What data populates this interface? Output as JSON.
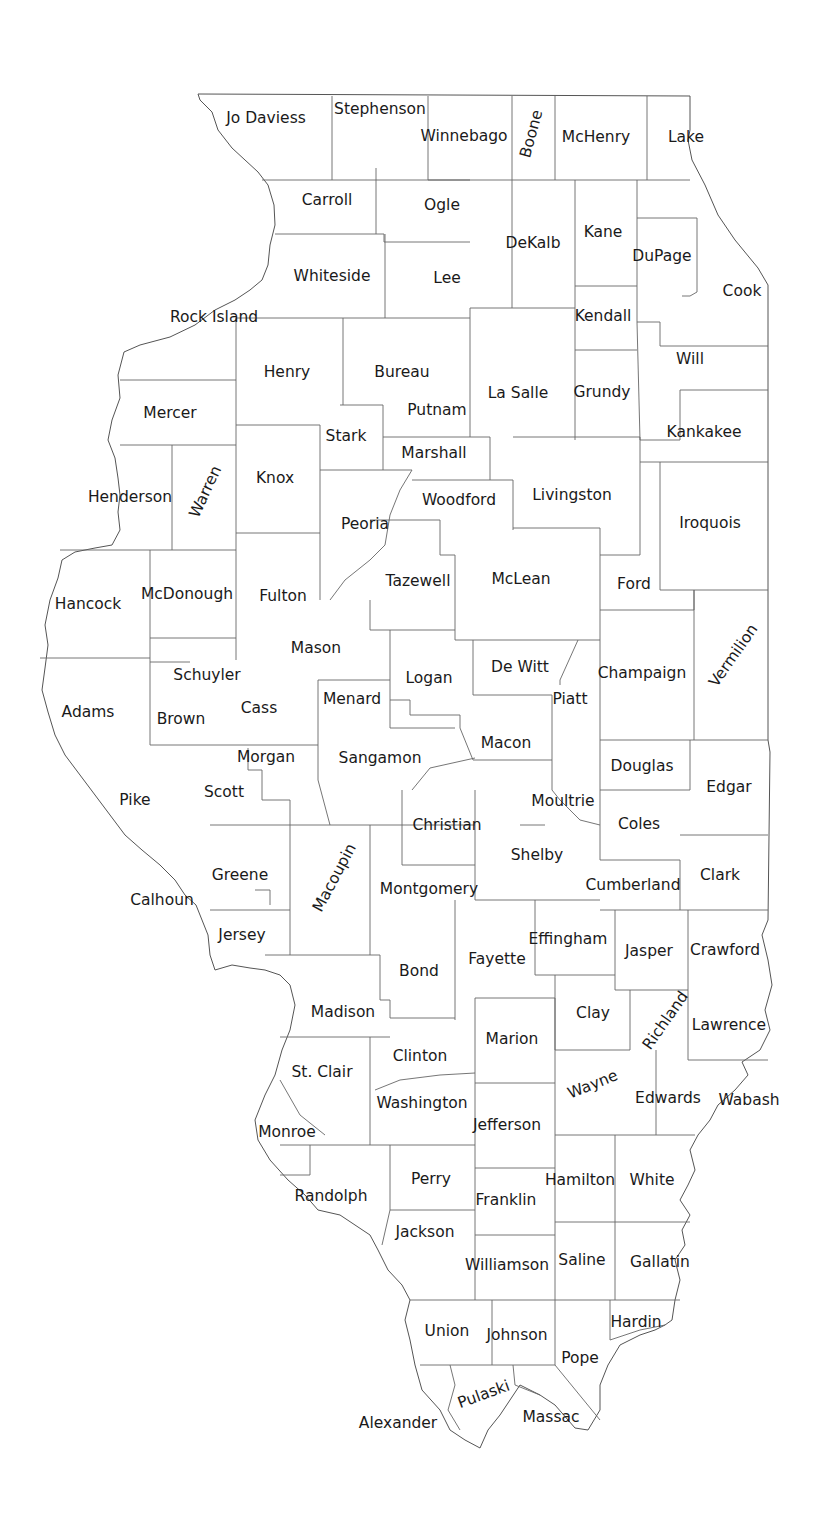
{
  "map": {
    "region": "Illinois",
    "line_color": "#555555",
    "label_color": "#1a1a1a",
    "counties": [
      {
        "name": "Jo Daviess",
        "x": 266,
        "y": 119
      },
      {
        "name": "Stephenson",
        "x": 380,
        "y": 110
      },
      {
        "name": "Winnebago",
        "x": 464,
        "y": 137
      },
      {
        "name": "Boone",
        "x": 532,
        "y": 134,
        "rotate": -75
      },
      {
        "name": "McHenry",
        "x": 596,
        "y": 138
      },
      {
        "name": "Lake",
        "x": 686,
        "y": 138
      },
      {
        "name": "Carroll",
        "x": 327,
        "y": 201
      },
      {
        "name": "Ogle",
        "x": 442,
        "y": 206
      },
      {
        "name": "DeKalb",
        "x": 533,
        "y": 244
      },
      {
        "name": "Kane",
        "x": 603,
        "y": 233
      },
      {
        "name": "DuPage",
        "x": 662,
        "y": 257
      },
      {
        "name": "Cook",
        "x": 742,
        "y": 292
      },
      {
        "name": "Whiteside",
        "x": 332,
        "y": 277
      },
      {
        "name": "Lee",
        "x": 447,
        "y": 279
      },
      {
        "name": "Rock Island",
        "x": 214,
        "y": 318
      },
      {
        "name": "Kendall",
        "x": 603,
        "y": 317
      },
      {
        "name": "Henry",
        "x": 287,
        "y": 373
      },
      {
        "name": "Bureau",
        "x": 402,
        "y": 373
      },
      {
        "name": "La Salle",
        "x": 518,
        "y": 394
      },
      {
        "name": "Grundy",
        "x": 602,
        "y": 393
      },
      {
        "name": "Will",
        "x": 690,
        "y": 360
      },
      {
        "name": "Putnam",
        "x": 437,
        "y": 411
      },
      {
        "name": "Mercer",
        "x": 170,
        "y": 414
      },
      {
        "name": "Stark",
        "x": 346,
        "y": 437
      },
      {
        "name": "Kankakee",
        "x": 704,
        "y": 433
      },
      {
        "name": "Marshall",
        "x": 434,
        "y": 454
      },
      {
        "name": "Knox",
        "x": 275,
        "y": 479
      },
      {
        "name": "Henderson",
        "x": 130,
        "y": 498
      },
      {
        "name": "Warren",
        "x": 206,
        "y": 492,
        "rotate": -65
      },
      {
        "name": "Woodford",
        "x": 459,
        "y": 501
      },
      {
        "name": "Livingston",
        "x": 572,
        "y": 496
      },
      {
        "name": "Iroquois",
        "x": 710,
        "y": 524
      },
      {
        "name": "Peoria",
        "x": 365,
        "y": 525
      },
      {
        "name": "Tazewell",
        "x": 418,
        "y": 582
      },
      {
        "name": "McLean",
        "x": 521,
        "y": 580
      },
      {
        "name": "Ford",
        "x": 634,
        "y": 585
      },
      {
        "name": "Hancock",
        "x": 88,
        "y": 605
      },
      {
        "name": "McDonough",
        "x": 187,
        "y": 595
      },
      {
        "name": "Fulton",
        "x": 283,
        "y": 597
      },
      {
        "name": "Mason",
        "x": 316,
        "y": 649
      },
      {
        "name": "Vermilion",
        "x": 734,
        "y": 656,
        "rotate": -55
      },
      {
        "name": "De Witt",
        "x": 520,
        "y": 668
      },
      {
        "name": "Champaign",
        "x": 642,
        "y": 674
      },
      {
        "name": "Schuyler",
        "x": 207,
        "y": 676
      },
      {
        "name": "Logan",
        "x": 429,
        "y": 679
      },
      {
        "name": "Menard",
        "x": 352,
        "y": 700
      },
      {
        "name": "Cass",
        "x": 259,
        "y": 709
      },
      {
        "name": "Piatt",
        "x": 570,
        "y": 700
      },
      {
        "name": "Adams",
        "x": 88,
        "y": 713
      },
      {
        "name": "Brown",
        "x": 181,
        "y": 720
      },
      {
        "name": "Macon",
        "x": 506,
        "y": 744
      },
      {
        "name": "Morgan",
        "x": 266,
        "y": 758
      },
      {
        "name": "Sangamon",
        "x": 380,
        "y": 759
      },
      {
        "name": "Douglas",
        "x": 642,
        "y": 767
      },
      {
        "name": "Edgar",
        "x": 729,
        "y": 788
      },
      {
        "name": "Scott",
        "x": 224,
        "y": 793
      },
      {
        "name": "Pike",
        "x": 135,
        "y": 801
      },
      {
        "name": "Moultrie",
        "x": 563,
        "y": 802
      },
      {
        "name": "Christian",
        "x": 447,
        "y": 826
      },
      {
        "name": "Coles",
        "x": 639,
        "y": 825
      },
      {
        "name": "Shelby",
        "x": 537,
        "y": 856
      },
      {
        "name": "Macoupin",
        "x": 335,
        "y": 878,
        "rotate": -62
      },
      {
        "name": "Greene",
        "x": 240,
        "y": 876
      },
      {
        "name": "Clark",
        "x": 720,
        "y": 876
      },
      {
        "name": "Montgomery",
        "x": 429,
        "y": 890
      },
      {
        "name": "Cumberland",
        "x": 633,
        "y": 886
      },
      {
        "name": "Calhoun",
        "x": 162,
        "y": 901
      },
      {
        "name": "Jersey",
        "x": 242,
        "y": 936
      },
      {
        "name": "Effingham",
        "x": 568,
        "y": 940
      },
      {
        "name": "Jasper",
        "x": 649,
        "y": 952
      },
      {
        "name": "Crawford",
        "x": 725,
        "y": 951
      },
      {
        "name": "Fayette",
        "x": 497,
        "y": 960
      },
      {
        "name": "Bond",
        "x": 419,
        "y": 972
      },
      {
        "name": "Clay",
        "x": 593,
        "y": 1014
      },
      {
        "name": "Richland",
        "x": 666,
        "y": 1021,
        "rotate": -55
      },
      {
        "name": "Madison",
        "x": 343,
        "y": 1013
      },
      {
        "name": "Lawrence",
        "x": 729,
        "y": 1026
      },
      {
        "name": "Marion",
        "x": 512,
        "y": 1040
      },
      {
        "name": "Clinton",
        "x": 420,
        "y": 1057
      },
      {
        "name": "Wayne",
        "x": 593,
        "y": 1085,
        "rotate": -22
      },
      {
        "name": "St. Clair",
        "x": 322,
        "y": 1073
      },
      {
        "name": "Edwards",
        "x": 668,
        "y": 1099
      },
      {
        "name": "Wabash",
        "x": 749,
        "y": 1101
      },
      {
        "name": "Washington",
        "x": 422,
        "y": 1104
      },
      {
        "name": "Jefferson",
        "x": 507,
        "y": 1126
      },
      {
        "name": "Monroe",
        "x": 287,
        "y": 1133
      },
      {
        "name": "Perry",
        "x": 431,
        "y": 1180
      },
      {
        "name": "Hamilton",
        "x": 580,
        "y": 1181
      },
      {
        "name": "White",
        "x": 652,
        "y": 1181
      },
      {
        "name": "Randolph",
        "x": 331,
        "y": 1197
      },
      {
        "name": "Franklin",
        "x": 506,
        "y": 1201
      },
      {
        "name": "Jackson",
        "x": 425,
        "y": 1233
      },
      {
        "name": "Williamson",
        "x": 507,
        "y": 1266
      },
      {
        "name": "Saline",
        "x": 582,
        "y": 1261
      },
      {
        "name": "Gallatin",
        "x": 660,
        "y": 1263
      },
      {
        "name": "Hardin",
        "x": 636,
        "y": 1323
      },
      {
        "name": "Union",
        "x": 447,
        "y": 1332
      },
      {
        "name": "Johnson",
        "x": 517,
        "y": 1336
      },
      {
        "name": "Pope",
        "x": 580,
        "y": 1359
      },
      {
        "name": "Pulaski",
        "x": 484,
        "y": 1395,
        "rotate": -20
      },
      {
        "name": "Massac",
        "x": 551,
        "y": 1418
      },
      {
        "name": "Alexander",
        "x": 398,
        "y": 1424
      }
    ]
  }
}
